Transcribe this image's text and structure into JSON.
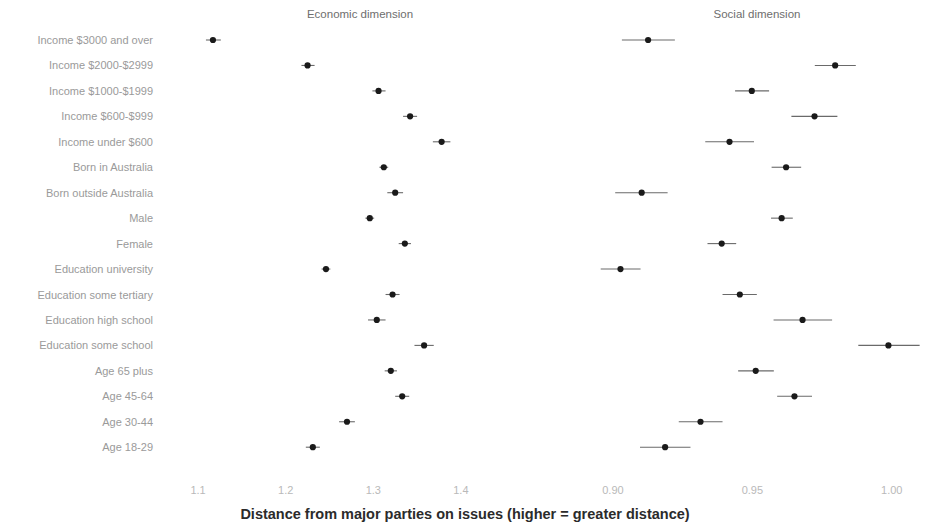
{
  "figure": {
    "axis_title": "Distance from major parties on issues (higher = greater distance)",
    "panels": [
      {
        "key": "economic",
        "title": "Economic dimension"
      },
      {
        "key": "social",
        "title": "Social dimension"
      }
    ]
  },
  "chart_data": {
    "type": "scatter",
    "title": "",
    "subtitle": "",
    "xlabel": "Distance from major parties on issues (higher = greater distance)",
    "ylabel": "",
    "grid": false,
    "legend": "none",
    "orientation": "horizontal-dot-plot-with-error-bars",
    "categories": [
      "Income $3000 and over",
      "Income $2000-$2999",
      "Income $1000-$1999",
      "Income $600-$999",
      "Income under $600",
      "Born in Australia",
      "Born outside Australia",
      "Male",
      "Female",
      "Education university",
      "Education some tertiary",
      "Education high school",
      "Education some school",
      "Age 65 plus",
      "Age 45-64",
      "Age 30-44",
      "Age 18-29"
    ],
    "panels": [
      {
        "name": "Economic dimension",
        "xlim": [
          1.06,
          1.48
        ],
        "ticks": [
          "1.1",
          "1.2",
          "1.3",
          "1.4"
        ],
        "tick_values": [
          1.1,
          1.2,
          1.3,
          1.4
        ],
        "estimates": [
          1.117,
          1.225,
          1.306,
          1.342,
          1.378,
          1.312,
          1.325,
          1.296,
          1.336,
          1.246,
          1.322,
          1.304,
          1.358,
          1.32,
          1.333,
          1.27,
          1.231
        ],
        "ci_low": [
          1.109,
          1.218,
          1.299,
          1.334,
          1.368,
          1.307,
          1.316,
          1.291,
          1.329,
          1.241,
          1.314,
          1.294,
          1.347,
          1.313,
          1.325,
          1.261,
          1.223
        ],
        "ci_high": [
          1.126,
          1.233,
          1.314,
          1.35,
          1.388,
          1.317,
          1.334,
          1.301,
          1.343,
          1.251,
          1.33,
          1.314,
          1.369,
          1.327,
          1.341,
          1.279,
          1.239
        ]
      },
      {
        "name": "Social dimension",
        "xlim": [
          0.881,
          1.013
        ],
        "ticks": [
          "0.90",
          "0.95",
          "1.00"
        ],
        "tick_values": [
          0.9,
          0.95,
          1.0
        ],
        "estimates": [
          0.9126,
          0.9797,
          0.9498,
          0.9723,
          0.9418,
          0.9621,
          0.9103,
          0.9605,
          0.939,
          0.9027,
          0.9455,
          0.968,
          0.9988,
          0.9512,
          0.9651,
          0.9314,
          0.9187
        ],
        "ci_low": [
          0.9032,
          0.9724,
          0.9438,
          0.964,
          0.9331,
          0.9569,
          0.9008,
          0.9567,
          0.9339,
          0.8956,
          0.9393,
          0.9576,
          0.988,
          0.9449,
          0.9589,
          0.9236,
          0.9097
        ],
        "ci_high": [
          0.9222,
          0.9871,
          0.956,
          0.9805,
          0.9506,
          0.9675,
          0.9196,
          0.9645,
          0.9442,
          0.9099,
          0.9516,
          0.9786,
          1.01,
          0.9577,
          0.9714,
          0.9393,
          0.9278
        ]
      }
    ]
  }
}
